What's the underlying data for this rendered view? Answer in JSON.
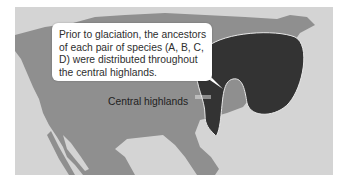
{
  "figure": {
    "colors": {
      "background": "#ffffff",
      "ocean": "#d4d4d4",
      "land": "#8f8f8f",
      "highlands": "#333333",
      "highlands_outline": "#e8e8e8",
      "callout_bg": "#ffffff",
      "text": "#2e2e2e"
    }
  },
  "callout": {
    "text": "Prior to glaciation, the ancestors of each pair of species (A, B, C, D) were distributed throughout the central highlands."
  },
  "labels": {
    "highlands": "Central highlands"
  }
}
